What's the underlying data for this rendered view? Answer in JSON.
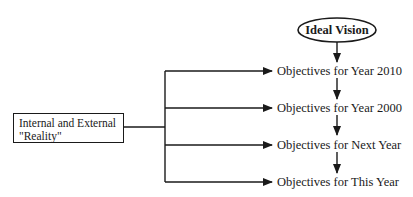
{
  "diagram": {
    "vision": {
      "label": "Ideal Vision",
      "shape": "ellipse"
    },
    "reality": {
      "line1": "Internal and External",
      "line2": "\"Reality\"",
      "shape": "rectangle"
    },
    "objectives": [
      {
        "label": "Objectives for Year 2010"
      },
      {
        "label": "Objectives for Year 2000"
      },
      {
        "label": "Objectives for Next Year"
      },
      {
        "label": "Objectives for This Year"
      }
    ],
    "edges": [
      {
        "from": "Ideal Vision",
        "to": "Objectives for Year 2010"
      },
      {
        "from": "Objectives for Year 2010",
        "to": "Objectives for Year 2000"
      },
      {
        "from": "Objectives for Year 2000",
        "to": "Objectives for Next Year"
      },
      {
        "from": "Objectives for Next Year",
        "to": "Objectives for This Year"
      },
      {
        "from": "Internal and External \"Reality\"",
        "to": "Objectives for Year 2010"
      },
      {
        "from": "Internal and External \"Reality\"",
        "to": "Objectives for Year 2000"
      },
      {
        "from": "Internal and External \"Reality\"",
        "to": "Objectives for Next Year"
      },
      {
        "from": "Internal and External \"Reality\"",
        "to": "Objectives for This Year"
      }
    ],
    "colors": {
      "line": "#1a1a1a",
      "background": "#ffffff"
    }
  }
}
